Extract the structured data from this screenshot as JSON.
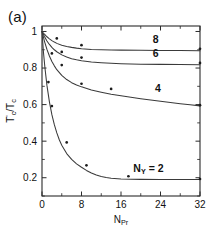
{
  "figure": {
    "panel_label": "(a)",
    "background": "#ffffff",
    "ink_color": "#2b2b2b"
  },
  "chart_data": {
    "type": "line",
    "title": "",
    "subtitle": "",
    "xlabel": "N_Pr",
    "xlabel_base": "N",
    "xlabel_sub": "Pr",
    "ylabel": "T'c / Tc",
    "ylabel_parts": {
      "t_prime": "T",
      "prime": "'",
      "sub_c1": "c",
      "slash": "/",
      "t2": "T",
      "sub_c2": "c"
    },
    "xlim": [
      0,
      32
    ],
    "ylim": [
      0.1,
      1.03
    ],
    "xticks": [
      0,
      8,
      16,
      24,
      32
    ],
    "xticklabels": [
      "0",
      "8",
      "16",
      "24",
      "32"
    ],
    "xminor_step": 4,
    "yticks": [
      0.2,
      0.4,
      0.6,
      0.8,
      1.0
    ],
    "yticklabels": [
      "0.2",
      "0.4",
      "0.6",
      "0.8",
      "1"
    ],
    "yminor_step": 0.1,
    "grid": false,
    "legend_position": "inline-curve-labels",
    "frame": "box-all-sides",
    "tick_direction": "in",
    "annotations": [
      {
        "text": "8",
        "x": 23.0,
        "y": 0.935
      },
      {
        "text": "6",
        "x": 23.0,
        "y": 0.862
      },
      {
        "text": "4",
        "x": 23.5,
        "y": 0.668
      },
      {
        "text": "N_Y = 2",
        "base": "N",
        "sub": "Y",
        "tail": " = 2",
        "x": 18.5,
        "y": 0.233
      }
    ],
    "series": [
      {
        "name": "8",
        "label": "8",
        "plateau": 0.9,
        "curve": [
          [
            0,
            1.0
          ],
          [
            0.5,
            0.985
          ],
          [
            1,
            0.971
          ],
          [
            1.5,
            0.96
          ],
          [
            2,
            0.95
          ],
          [
            2.5,
            0.942
          ],
          [
            3,
            0.935
          ],
          [
            4,
            0.925
          ],
          [
            5,
            0.918
          ],
          [
            6,
            0.913
          ],
          [
            7,
            0.909
          ],
          [
            8,
            0.906
          ],
          [
            10,
            0.902
          ],
          [
            12,
            0.9
          ],
          [
            14,
            0.899
          ],
          [
            16,
            0.898
          ],
          [
            20,
            0.897
          ],
          [
            24,
            0.896
          ],
          [
            28,
            0.896
          ],
          [
            32,
            0.895
          ]
        ],
        "points": [
          [
            3.0,
            0.962
          ],
          [
            8.0,
            0.925
          ],
          [
            32,
            0.905
          ]
        ]
      },
      {
        "name": "6",
        "label": "6",
        "plateau": 0.82,
        "curve": [
          [
            0,
            1.0
          ],
          [
            0.5,
            0.972
          ],
          [
            1,
            0.948
          ],
          [
            1.5,
            0.929
          ],
          [
            2,
            0.913
          ],
          [
            2.5,
            0.9
          ],
          [
            3,
            0.889
          ],
          [
            4,
            0.872
          ],
          [
            5,
            0.86
          ],
          [
            6,
            0.851
          ],
          [
            7,
            0.845
          ],
          [
            8,
            0.84
          ],
          [
            10,
            0.833
          ],
          [
            12,
            0.829
          ],
          [
            14,
            0.826
          ],
          [
            16,
            0.824
          ],
          [
            20,
            0.821
          ],
          [
            24,
            0.82
          ],
          [
            28,
            0.819
          ],
          [
            32,
            0.818
          ]
        ],
        "points": [
          [
            4.0,
            0.888
          ],
          [
            8.0,
            0.857
          ],
          [
            32,
            0.828
          ]
        ]
      },
      {
        "name": "4",
        "label": "4",
        "plateau": 0.59,
        "curve": [
          [
            0,
            1.0
          ],
          [
            0.5,
            0.946
          ],
          [
            1,
            0.902
          ],
          [
            1.5,
            0.866
          ],
          [
            2,
            0.836
          ],
          [
            2.5,
            0.812
          ],
          [
            3,
            0.791
          ],
          [
            4,
            0.76
          ],
          [
            5,
            0.737
          ],
          [
            6,
            0.72
          ],
          [
            7,
            0.707
          ],
          [
            8,
            0.697
          ],
          [
            10,
            0.68
          ],
          [
            12,
            0.668
          ],
          [
            14,
            0.657
          ],
          [
            16,
            0.648
          ],
          [
            18,
            0.64
          ],
          [
            20,
            0.632
          ],
          [
            22,
            0.625
          ],
          [
            24,
            0.618
          ],
          [
            26,
            0.611
          ],
          [
            28,
            0.605
          ],
          [
            30,
            0.599
          ],
          [
            32,
            0.593
          ]
        ],
        "points": [
          [
            2.0,
            0.88
          ],
          [
            4.0,
            0.816
          ],
          [
            8.0,
            0.714
          ],
          [
            14.0,
            0.686
          ],
          [
            32,
            0.597
          ]
        ]
      },
      {
        "name": "N_Y = 2",
        "label": "2",
        "plateau": 0.19,
        "curve": [
          [
            0,
            1.0
          ],
          [
            0.3,
            0.885
          ],
          [
            0.6,
            0.8
          ],
          [
            1,
            0.705
          ],
          [
            1.5,
            0.615
          ],
          [
            2,
            0.545
          ],
          [
            2.5,
            0.49
          ],
          [
            3,
            0.445
          ],
          [
            3.5,
            0.408
          ],
          [
            4,
            0.378
          ],
          [
            5,
            0.332
          ],
          [
            6,
            0.3
          ],
          [
            7,
            0.276
          ],
          [
            8,
            0.257
          ],
          [
            9,
            0.24
          ],
          [
            10,
            0.226
          ],
          [
            11,
            0.215
          ],
          [
            12,
            0.207
          ],
          [
            13,
            0.201
          ],
          [
            14,
            0.197
          ],
          [
            16,
            0.193
          ],
          [
            20,
            0.191
          ],
          [
            24,
            0.19
          ],
          [
            28,
            0.19
          ],
          [
            32,
            0.19
          ]
        ],
        "points": [
          [
            1.3,
            0.723
          ],
          [
            2.0,
            0.592
          ],
          [
            5.0,
            0.393
          ],
          [
            9.0,
            0.268
          ],
          [
            17.5,
            0.208
          ],
          [
            32,
            0.193
          ]
        ]
      }
    ]
  }
}
